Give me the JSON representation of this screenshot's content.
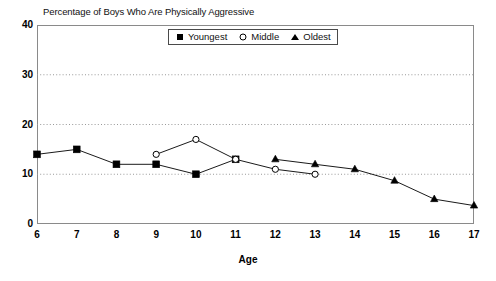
{
  "chart_data": {
    "type": "line",
    "title": "Percentage of Boys Who Are Physically Aggressive",
    "xlabel": "Age",
    "ylabel": "",
    "x": [
      6,
      7,
      8,
      9,
      10,
      11,
      12,
      13,
      14,
      15,
      16,
      17
    ],
    "xtick_labels": [
      "6",
      "7",
      "8",
      "9",
      "10",
      "11",
      "12",
      "13",
      "14",
      "15",
      "16",
      "17"
    ],
    "ytick_labels": [
      "0",
      "10",
      "20",
      "30",
      "40"
    ],
    "yticks": [
      0,
      10,
      20,
      30,
      40
    ],
    "xlim": [
      6,
      17
    ],
    "ylim": [
      0,
      40
    ],
    "grid": "horizontal-dotted",
    "legend_position": "top-center-inside",
    "series": [
      {
        "name": "Youngest",
        "marker": "filled-square",
        "x": [
          6,
          7,
          8,
          9,
          10,
          11
        ],
        "values": [
          14,
          15,
          12,
          12,
          10,
          13
        ]
      },
      {
        "name": "Middle",
        "marker": "open-circle",
        "x": [
          9,
          10,
          11,
          12,
          13
        ],
        "values": [
          14,
          17,
          13,
          11,
          10
        ]
      },
      {
        "name": "Oldest",
        "marker": "filled-triangle",
        "x": [
          12,
          13,
          14,
          15,
          16,
          17
        ],
        "values": [
          13,
          12,
          11,
          8.7,
          5,
          3.7
        ]
      }
    ]
  },
  "legend": {
    "entries": [
      {
        "label": "Youngest",
        "marker": "filled-square"
      },
      {
        "label": "Middle",
        "marker": "open-circle"
      },
      {
        "label": "Oldest",
        "marker": "filled-triangle"
      }
    ]
  },
  "colors": {
    "ink": "#000000",
    "frame": "#8a8a8a",
    "gridline": "#999999",
    "background": "#ffffff"
  }
}
